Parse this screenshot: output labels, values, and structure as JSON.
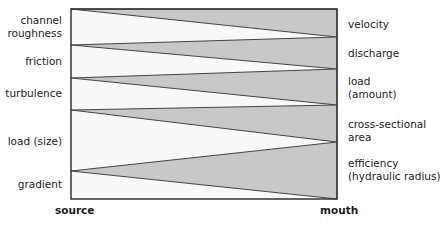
{
  "diagram": {
    "box": {
      "x1": 71,
      "y1": 9,
      "x2": 337,
      "y2": 199,
      "stroke": "#333333",
      "fill": "#f8f8f8"
    },
    "wedge_fill": "#c8c8c8",
    "wedges": [
      {
        "apex_y": 9,
        "base_top_y": 9,
        "base_bottom_y": 37
      },
      {
        "apex_y": 45,
        "base_top_y": 37,
        "base_bottom_y": 69
      },
      {
        "apex_y": 78,
        "base_top_y": 69,
        "base_bottom_y": 105
      },
      {
        "apex_y": 110,
        "base_top_y": 105,
        "base_bottom_y": 142
      },
      {
        "apex_y": 171,
        "base_top_y": 142,
        "base_bottom_y": 199
      }
    ],
    "left_labels": [
      {
        "text": "channel\nroughness",
        "line1": "channel",
        "line2": "roughness"
      },
      {
        "text": "friction"
      },
      {
        "text": "turbulence"
      },
      {
        "text": "load (size)"
      },
      {
        "text": "gradient"
      }
    ],
    "right_labels": [
      {
        "line1": "velocity"
      },
      {
        "line1": "discharge"
      },
      {
        "line1": "load",
        "line2": "(amount)"
      },
      {
        "line1": "cross-sectional area"
      },
      {
        "line1": "efficiency",
        "line2": "(hydraulic radius)"
      }
    ],
    "axis": {
      "start": "source",
      "end": "mouth"
    }
  }
}
